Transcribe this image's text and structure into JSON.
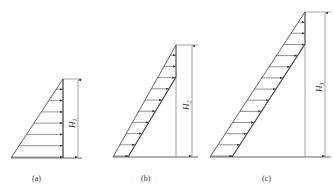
{
  "figure": {
    "panels": [
      {
        "id": "a",
        "caption": "(a)",
        "height_label": "H",
        "height_sub": "1",
        "arrows": 7
      },
      {
        "id": "b",
        "caption": "(b)",
        "height_label": "H",
        "height_sub": "2",
        "arrows": 10
      },
      {
        "id": "c",
        "caption": "(c)",
        "height_label": "H",
        "height_sub": "3",
        "arrows": 13
      }
    ]
  },
  "colors": {
    "line": "#3a3a3a",
    "background": "#ffffff"
  }
}
